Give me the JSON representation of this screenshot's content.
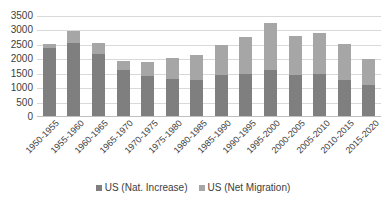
{
  "chart_data": {
    "type": "bar",
    "subtype": "stacked-column",
    "title": "",
    "xlabel": "",
    "ylabel": "",
    "ylim": [
      0,
      3500
    ],
    "ytick_step": 500,
    "yticks": [
      3500,
      3000,
      2500,
      2000,
      1500,
      1000,
      500,
      0
    ],
    "ytick_labels": [
      "3500",
      "3000",
      "2500",
      "2000",
      "1500",
      "1000",
      "500",
      "0"
    ],
    "grid": true,
    "legend_position": "bottom",
    "categories": [
      "1950-1955",
      "1955-1960",
      "1960-1965",
      "1965-1970",
      "1970-1975",
      "1975-1980",
      "1980-1985",
      "1985-1990",
      "1990-1995",
      "1995-2000",
      "2000-2005",
      "2005-2010",
      "2010-2015",
      "2015-2020"
    ],
    "series": [
      {
        "name": "US (Nat. Increase)",
        "color": "#7f7f7f",
        "values": [
          2400,
          2550,
          2200,
          1620,
          1420,
          1320,
          1300,
          1450,
          1480,
          1630,
          1450,
          1500,
          1300,
          1120
        ]
      },
      {
        "name": "US (Net Migration)",
        "color": "#a6a6a6",
        "values": [
          130,
          420,
          360,
          310,
          480,
          710,
          840,
          1030,
          1280,
          1620,
          1350,
          1400,
          1230,
          900
        ]
      }
    ],
    "totals": [
      2530,
      2970,
      2560,
      1930,
      1900,
      2030,
      2140,
      2480,
      2760,
      3250,
      2800,
      2900,
      2530,
      2020
    ]
  },
  "legend": {
    "items": [
      {
        "label": "US (Nat. Increase)",
        "color": "#7f7f7f",
        "swatch": "square-marker"
      },
      {
        "label": "US (Net Migration)",
        "color": "#a6a6a6",
        "swatch": "square-marker"
      }
    ]
  },
  "colors": {
    "nat_increase": "#7f7f7f",
    "net_migration": "#a6a6a6",
    "gridline": "#d9d9d9",
    "axis": "#bfbfbf",
    "text": "#404040",
    "background": "#ffffff"
  }
}
